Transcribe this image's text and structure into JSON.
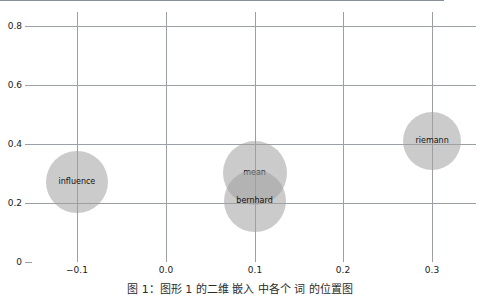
{
  "chart_data": {
    "type": "scatter",
    "title": "",
    "subtitle": "",
    "xlabel": "",
    "ylabel": "",
    "xlim": [
      -0.1506,
      0.3494
    ],
    "ylim": [
      0.0,
      0.846
    ],
    "grid": true,
    "legend": null,
    "x_ticks": [
      -0.1,
      0.0,
      0.1,
      0.2,
      0.3
    ],
    "x_tick_labels": [
      "−0.1",
      "0.0",
      "0.1",
      "0.2",
      "0.3"
    ],
    "y_ticks": [
      0,
      0.2,
      0.4,
      0.6,
      0.8
    ],
    "y_tick_labels": [
      "0",
      "0.2",
      "0.4",
      "0.6",
      "0.8"
    ],
    "point_label_key": "label",
    "points": [
      {
        "label": "influence",
        "x": -0.1,
        "y": 0.272,
        "size_px": 31,
        "color": "#a0a0a0"
      },
      {
        "label": "mean",
        "x": 0.1,
        "y": 0.3,
        "size_px": 32,
        "color": "#a0a0a0"
      },
      {
        "label": "bernhard",
        "x": 0.1,
        "y": 0.205,
        "size_px": 31,
        "color": "#a0a0a0"
      },
      {
        "label": "riemann",
        "x": 0.3,
        "y": 0.41,
        "size_px": 29,
        "color": "#a0a0a0"
      }
    ]
  },
  "caption": {
    "text": "图 1：图形 1 的二维 嵌入 中各个 词 的位置图"
  },
  "colors": {
    "bubble_fill": "#a0a0a0",
    "grid": "#9aa0a6",
    "axis": "#8a9097",
    "text": "#1a1a1a",
    "background": "#ffffff"
  }
}
